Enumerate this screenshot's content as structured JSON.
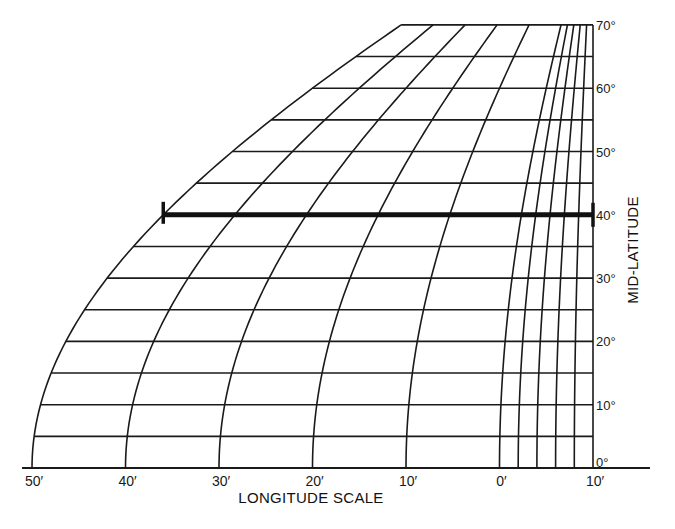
{
  "diagram": {
    "type": "longitude-scale-nomogram",
    "x_axis_title": "LONGITUDE SCALE",
    "y_axis_title": "MID-LATITUDE",
    "longitude_labels": [
      {
        "text": "50′",
        "minutes": 50
      },
      {
        "text": "40′",
        "minutes": 40
      },
      {
        "text": "30′",
        "minutes": 30
      },
      {
        "text": "20′",
        "minutes": 20
      },
      {
        "text": "10′",
        "minutes": 10
      },
      {
        "text": "0′",
        "minutes": 0
      },
      {
        "text": "10′",
        "minutes": -10
      }
    ],
    "major_meridians_minutes": [
      50,
      40,
      30,
      20,
      10,
      0
    ],
    "fine_meridians_minutes": [
      -2,
      -4,
      -6,
      -8,
      -10
    ],
    "latitude_labels": [
      {
        "text": "0°",
        "lat": 0
      },
      {
        "text": "10°",
        "lat": 10
      },
      {
        "text": "20°",
        "lat": 20
      },
      {
        "text": "30°",
        "lat": 30
      },
      {
        "text": "40°",
        "lat": 40
      },
      {
        "text": "50°",
        "lat": 50
      },
      {
        "text": "60°",
        "lat": 60
      },
      {
        "text": "70°",
        "lat": 70
      }
    ],
    "parallel_step_deg": 5,
    "lat_range": [
      0,
      70
    ],
    "highlight": {
      "description": "measured distance at mid-latitude 40°",
      "lat": 40,
      "from_minutes": 50,
      "to_minutes": -10
    },
    "colors": {
      "ink": "#1a1a1a",
      "background": "#ffffff"
    }
  }
}
